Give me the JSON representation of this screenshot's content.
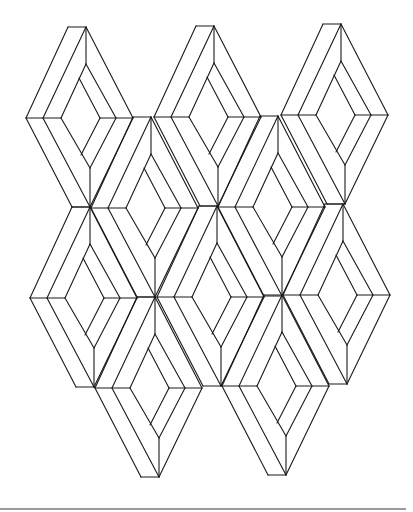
{
  "figure": {
    "stroke_color": "#1a1a1a",
    "background_color": "#ffffff",
    "stroke_width": 1.1,
    "rule_color": "#9a9a9a"
  },
  "unit_template": {
    "description": "One diamond-frame unit; coordinates relative to apex (0,0); height 180, mid at y=91",
    "segments": [
      [
        -18,
        0,
        0,
        0
      ],
      [
        -18,
        0,
        -60,
        91
      ],
      [
        0,
        0,
        -43,
        91
      ],
      [
        0,
        0,
        0,
        37
      ],
      [
        0,
        0,
        47,
        91
      ],
      [
        0,
        37,
        30,
        91
      ],
      [
        0,
        37,
        -25,
        91
      ],
      [
        -7,
        51,
        14,
        91
      ],
      [
        -60,
        91,
        -25,
        91
      ],
      [
        14,
        91,
        47,
        91
      ],
      [
        -60,
        91,
        -14,
        180
      ],
      [
        -14,
        180,
        4,
        180
      ],
      [
        -43,
        91,
        4,
        180
      ],
      [
        -25,
        91,
        4,
        141
      ],
      [
        4,
        141,
        4,
        180
      ],
      [
        14,
        91,
        -5,
        128
      ],
      [
        30,
        91,
        4,
        141
      ],
      [
        47,
        91,
        4,
        180
      ]
    ]
  },
  "units": [
    {
      "row": 1,
      "col": 1,
      "x": 86,
      "y": 27
    },
    {
      "row": 1,
      "col": 2,
      "x": 214,
      "y": 26
    },
    {
      "row": 1,
      "col": 3,
      "x": 341,
      "y": 24
    },
    {
      "row": 2,
      "col": 1,
      "x": 151,
      "y": 117
    },
    {
      "row": 2,
      "col": 2,
      "x": 278,
      "y": 116
    },
    {
      "row": 3,
      "col": 1,
      "x": 90,
      "y": 207
    },
    {
      "row": 3,
      "col": 2,
      "x": 217,
      "y": 206
    },
    {
      "row": 3,
      "col": 3,
      "x": 343,
      "y": 204
    },
    {
      "row": 4,
      "col": 1,
      "x": 155,
      "y": 297
    },
    {
      "row": 4,
      "col": 2,
      "x": 282,
      "y": 295
    }
  ]
}
